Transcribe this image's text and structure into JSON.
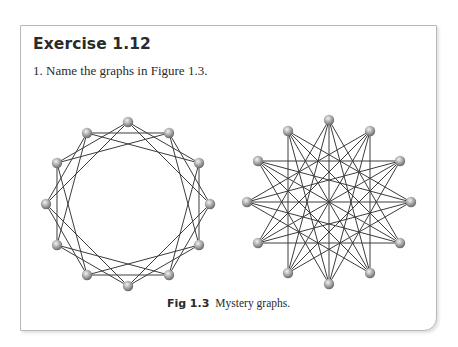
{
  "exercise": {
    "title": "Exercise 1.12",
    "question": "1. Name the graphs in Figure 1.3."
  },
  "figure": {
    "label": "Fig 1.3",
    "caption": "Mystery graphs.",
    "edge_color": "#3c3c3c",
    "node_color": "#a8a8a8",
    "graphs": [
      {
        "name": "left-graph",
        "nodes": 12,
        "cx": 128,
        "cy": 204,
        "r": 82,
        "connection_distances": [
          2,
          3
        ]
      },
      {
        "name": "right-graph",
        "nodes": 12,
        "cx": 329,
        "cy": 202,
        "r": 82,
        "connection_distances": [
          4,
          5,
          6
        ]
      }
    ]
  }
}
